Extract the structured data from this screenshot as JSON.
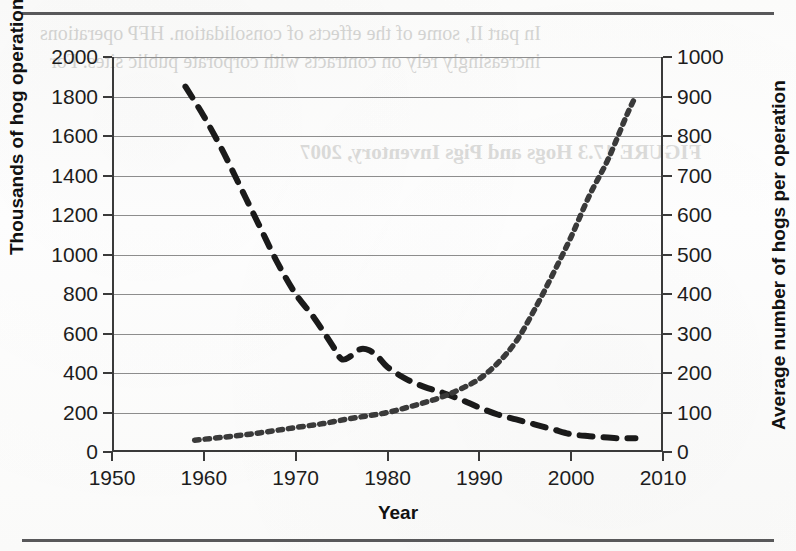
{
  "figure": {
    "ghost_text": [
      "In part II, some of the effects of consolidation. HFP operations",
      "increasingly rely on contracts with corporate public sites. For",
      "FIGURE 17.3   Hogs and Pigs Inventory, 2007"
    ]
  },
  "chart_data": {
    "type": "line",
    "title": "",
    "xlabel": "Year",
    "ylabel": "Thousands of hog operations",
    "y2label": "Average number of hogs per operation",
    "xlim": [
      1950,
      2010
    ],
    "ylim": [
      0,
      2000
    ],
    "y2lim": [
      0,
      1000
    ],
    "xticks": [
      1950,
      1960,
      1970,
      1980,
      1990,
      2000,
      2010
    ],
    "yticks": [
      0,
      200,
      400,
      600,
      800,
      1000,
      1200,
      1400,
      1600,
      1800,
      2000
    ],
    "y2ticks": [
      0,
      100,
      200,
      300,
      400,
      500,
      600,
      700,
      800,
      900,
      1000
    ],
    "grid": true,
    "legend": "none",
    "series": [
      {
        "name": "Thousands of hog operations",
        "axis": "left",
        "style": "dashed",
        "color": "#1a1a1a",
        "x": [
          1958,
          1960,
          1962,
          1964,
          1966,
          1968,
          1970,
          1972,
          1974,
          1975,
          1976,
          1977,
          1978,
          1979,
          1980,
          1982,
          1984,
          1986,
          1988,
          1990,
          1992,
          1994,
          1996,
          1998,
          2000,
          2002,
          2004,
          2005,
          2006,
          2007
        ],
        "values": [
          1850,
          1700,
          1530,
          1340,
          1150,
          960,
          800,
          680,
          540,
          470,
          485,
          520,
          515,
          480,
          430,
          370,
          330,
          300,
          265,
          225,
          190,
          165,
          140,
          115,
          90,
          80,
          73,
          70,
          70,
          70
        ]
      },
      {
        "name": "Average number of hogs per operation",
        "axis": "right",
        "style": "dotted",
        "color": "#3a3a3a",
        "x": [
          1959,
          1962,
          1965,
          1968,
          1970,
          1973,
          1976,
          1978,
          1980,
          1982,
          1984,
          1986,
          1988,
          1990,
          1992,
          1994,
          1996,
          1998,
          2000,
          2002,
          2004,
          2006,
          2007
        ],
        "values": [
          30,
          37,
          45,
          55,
          62,
          72,
          85,
          92,
          100,
          112,
          125,
          140,
          160,
          185,
          225,
          280,
          360,
          450,
          545,
          650,
          740,
          850,
          900
        ]
      }
    ]
  }
}
